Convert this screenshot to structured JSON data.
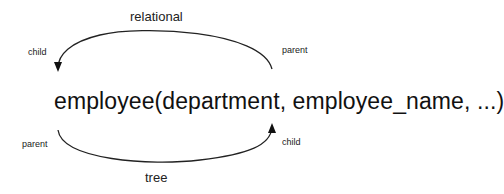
{
  "diagram": {
    "expression": "employee(department, employee_name, ...)",
    "top_arc": {
      "label": "relational",
      "left_label": "child",
      "right_label": "parent"
    },
    "bottom_arc": {
      "label": "tree",
      "left_label": "parent",
      "right_label": "child"
    }
  }
}
